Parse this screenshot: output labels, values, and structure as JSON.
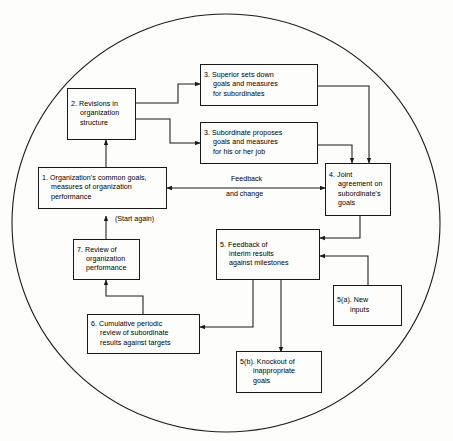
{
  "diagram": {
    "shape": "circle",
    "background_color": "#fdfdfb",
    "line_color": "#1a1a1a",
    "boxes": [
      {
        "id": "box1",
        "name": "organization-common-goals",
        "lines": [
          "1.  Organization's common goals,",
          "measures of organization",
          "performance"
        ]
      },
      {
        "id": "box2",
        "name": "revisions-in-organization-structure",
        "lines": [
          "2.  Revisions in",
          "organization",
          "structure"
        ]
      },
      {
        "id": "box3a",
        "name": "superior-sets-down-goals",
        "lines": [
          "3.  Superior sets down",
          "goals and measures",
          "for subordinates"
        ]
      },
      {
        "id": "box3b",
        "name": "subordinate-proposes-goals",
        "lines": [
          "3.  Subordinate proposes",
          "goals and measures",
          "for his or her job"
        ]
      },
      {
        "id": "box4",
        "name": "joint-agreement-on-goals",
        "lines": [
          "4.  Joint",
          "agreement on",
          "subordinate's",
          "goals"
        ]
      },
      {
        "id": "box5",
        "name": "feedback-of-interim-results",
        "lines": [
          "5.  Feedback of",
          "interim results",
          "against milestones"
        ]
      },
      {
        "id": "box5a",
        "name": "new-inputs",
        "lines": [
          "5(a).  New",
          "inputs"
        ]
      },
      {
        "id": "box5b",
        "name": "knockout-of-inappropriate-goals",
        "lines": [
          "5(b).  Knockout of",
          "inappropriate",
          "goals"
        ]
      },
      {
        "id": "box6",
        "name": "cumulative-periodic-review",
        "lines": [
          "6.  Cumulative periodic",
          "review of subordinate",
          "results against targets"
        ]
      },
      {
        "id": "box7",
        "name": "review-of-organization-performance",
        "lines": [
          "7.  Review of",
          "organization",
          "performance"
        ]
      }
    ],
    "labels": {
      "feedback": "Feedback",
      "and_change": "and change",
      "start_again": "(Start again)"
    }
  }
}
